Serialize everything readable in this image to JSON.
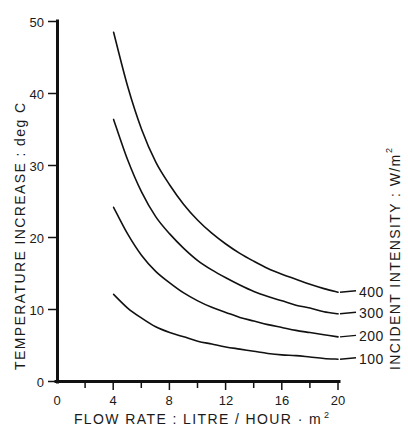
{
  "chart_data": {
    "type": "line",
    "title": "",
    "subtitle": "",
    "xlabel": "FLOW RATE : LITRE / HOUR · m²",
    "ylabel": "TEMPERATURE INCREASE : deg C",
    "right_axis_label": "INCIDENT INTENSITY : W/m²",
    "xlim": [
      0,
      20
    ],
    "ylim": [
      0,
      50
    ],
    "xticks": [
      0,
      4,
      8,
      12,
      16,
      20
    ],
    "xtick_labels": [
      "0",
      "4",
      "8",
      "12",
      "16",
      "20"
    ],
    "xminor_step": 2,
    "yticks": [
      0,
      10,
      20,
      30,
      40,
      50
    ],
    "ytick_labels": [
      "0",
      "10",
      "20",
      "30",
      "40",
      "50"
    ],
    "grid": false,
    "legend_position": "right-of-curve-ends",
    "x": [
      4,
      5,
      6,
      7,
      8,
      9,
      10,
      11,
      12,
      13,
      14,
      15,
      16,
      17,
      18,
      19,
      20
    ],
    "series": [
      {
        "name": "400",
        "label": "400",
        "unit": "W/m²",
        "values": [
          48.5,
          41.0,
          35.0,
          30.5,
          27.3,
          24.6,
          22.4,
          20.6,
          19.1,
          17.8,
          16.7,
          15.7,
          14.9,
          14.2,
          13.5,
          12.9,
          12.4
        ]
      },
      {
        "name": "300",
        "label": "300",
        "unit": "W/m²",
        "values": [
          36.4,
          30.8,
          26.3,
          22.9,
          20.5,
          18.5,
          16.8,
          15.5,
          14.4,
          13.4,
          12.5,
          11.8,
          11.2,
          10.6,
          10.2,
          9.7,
          9.4
        ]
      },
      {
        "name": "200",
        "label": "200",
        "unit": "W/m²",
        "values": [
          24.2,
          20.5,
          17.5,
          15.3,
          13.7,
          12.3,
          11.2,
          10.3,
          9.6,
          8.9,
          8.4,
          7.9,
          7.5,
          7.1,
          6.8,
          6.5,
          6.2
        ]
      },
      {
        "name": "100",
        "label": "100",
        "unit": "W/m²",
        "values": [
          12.1,
          10.2,
          8.8,
          7.6,
          6.8,
          6.2,
          5.6,
          5.2,
          4.8,
          4.5,
          4.2,
          3.9,
          3.7,
          3.6,
          3.4,
          3.2,
          3.1
        ]
      }
    ],
    "colors": {
      "line": "#111111",
      "axis": "#111111",
      "text": "#1a1a1a",
      "background": "#ffffff"
    }
  },
  "axes": {
    "y_label_text": "TEMPERATURE INCREASE : deg C",
    "x_label_text": "FLOW RATE : LITRE / HOUR · m",
    "x_label_sup": "2",
    "right_label_text": "INCIDENT INTENSITY : W/m",
    "right_label_sup": "2"
  },
  "ticks": {
    "y": {
      "t0": "0",
      "t10": "10",
      "t20": "20",
      "t30": "30",
      "t40": "40",
      "t50": "50"
    },
    "x": {
      "t0": "0",
      "t4": "4",
      "t8": "8",
      "t12": "12",
      "t16": "16",
      "t20": "20"
    }
  },
  "series_labels": {
    "s400": "400",
    "s300": "300",
    "s200": "200",
    "s100": "100"
  }
}
